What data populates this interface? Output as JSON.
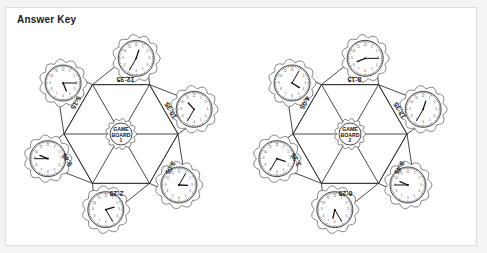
{
  "page": {
    "title": "Answer Key",
    "background_color": "#ffffff",
    "outer_background_color": "#f4f4f4",
    "line_color": "#333333"
  },
  "boards": [
    {
      "id": "game-board-1",
      "center_label_line1": "GAME",
      "center_label_line2": "BOARD",
      "center_label_line3": "1",
      "flaps": [
        {
          "position": "top-left",
          "time": "5:15",
          "hour": 5,
          "minute": 15
        },
        {
          "position": "top-right",
          "time": "12:35",
          "hour": 12,
          "minute": 35
        },
        {
          "position": "left",
          "time": "9:45",
          "hour": 9,
          "minute": 45
        },
        {
          "position": "right",
          "time": "10:35",
          "hour": 10,
          "minute": 35
        },
        {
          "position": "bottom-left",
          "time": "2:25",
          "hour": 2,
          "minute": 25
        },
        {
          "position": "bottom-right",
          "time": "3:05",
          "hour": 3,
          "minute": 5
        }
      ]
    },
    {
      "id": "game-board-2",
      "center_label_line1": "GAME",
      "center_label_line2": "BOARD",
      "center_label_line3": "2",
      "flaps": [
        {
          "position": "top-left",
          "time": "4:05",
          "hour": 4,
          "minute": 5
        },
        {
          "position": "top-right",
          "time": "8:15",
          "hour": 8,
          "minute": 15
        },
        {
          "position": "left",
          "time": "3:35",
          "hour": 3,
          "minute": 35
        },
        {
          "position": "right",
          "time": "12:35",
          "hour": 12,
          "minute": 35
        },
        {
          "position": "bottom-left",
          "time": "6:25",
          "hour": 6,
          "minute": 25
        },
        {
          "position": "bottom-right",
          "time": "9:45",
          "hour": 9,
          "minute": 45
        }
      ]
    }
  ]
}
